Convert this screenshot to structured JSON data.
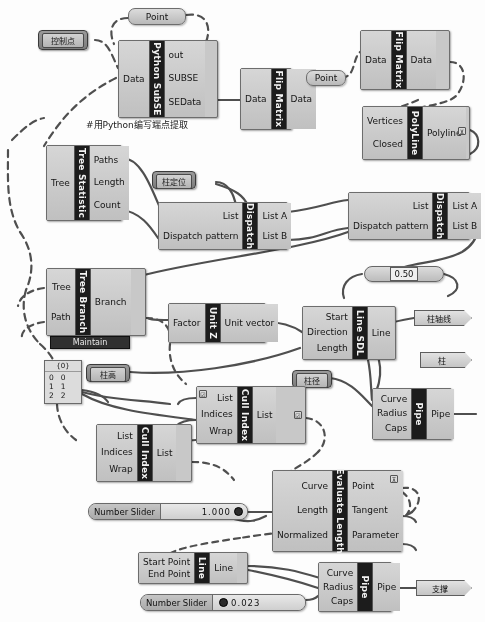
{
  "app": {
    "title": "Grasshopper Definition Canvas"
  },
  "comment": {
    "python_note": "#用Python编写端点提取"
  },
  "labels": {
    "control_points": "控制点",
    "column_position": "柱定位",
    "column_height": "柱高",
    "column_diameter": "柱径",
    "column_axis": "柱轴线",
    "column": "柱",
    "support": "支撑"
  },
  "components": [
    {
      "id": "python-subse",
      "name": "Python SubSE",
      "inputs": [
        "Data"
      ],
      "outputs": [
        "out",
        "SUBSE",
        "SEData"
      ]
    },
    {
      "id": "flip-matrix-1",
      "name": "Flip Matrix",
      "inputs": [
        "Data"
      ],
      "outputs": [
        "Data"
      ]
    },
    {
      "id": "flip-matrix-2",
      "name": "Flip Matrix",
      "inputs": [
        "Data"
      ],
      "outputs": [
        "Data"
      ]
    },
    {
      "id": "polyline",
      "name": "PolyLine",
      "inputs": [
        "Vertices",
        "Closed"
      ],
      "outputs": [
        "Polyline"
      ]
    },
    {
      "id": "tree-statistics",
      "name": "Tree Statistic",
      "inputs": [
        "Tree"
      ],
      "outputs": [
        "Paths",
        "Length",
        "Count"
      ]
    },
    {
      "id": "dispatch-1",
      "name": "Dispatch",
      "inputs": [
        "List",
        "Dispatch pattern"
      ],
      "outputs": [
        "List A",
        "List B"
      ]
    },
    {
      "id": "dispatch-2",
      "name": "Dispatch",
      "inputs": [
        "List",
        "Dispatch pattern"
      ],
      "outputs": [
        "List A",
        "List B"
      ]
    },
    {
      "id": "tree-branch",
      "name": "Tree Branch",
      "inputs": [
        "Tree",
        "Path"
      ],
      "outputs": [
        "Branch"
      ],
      "sub": "Maintain"
    },
    {
      "id": "unit-z",
      "name": "Unit Z",
      "inputs": [
        "Factor"
      ],
      "outputs": [
        "Unit vector"
      ]
    },
    {
      "id": "line-sdl",
      "name": "Line SDL",
      "inputs": [
        "Start",
        "Direction",
        "Length"
      ],
      "outputs": [
        "Line"
      ]
    },
    {
      "id": "cull-index-1",
      "name": "Cull Index",
      "inputs": [
        "List",
        "Indices",
        "Wrap"
      ],
      "outputs": [
        "List"
      ]
    },
    {
      "id": "cull-index-2",
      "name": "Cull Index",
      "inputs": [
        "List",
        "Indices",
        "Wrap"
      ],
      "outputs": [
        "List"
      ]
    },
    {
      "id": "pipe-1",
      "name": "Pipe",
      "inputs": [
        "Curve",
        "Radius",
        "Caps"
      ],
      "outputs": [
        "Pipe"
      ]
    },
    {
      "id": "pipe-2",
      "name": "Pipe",
      "inputs": [
        "Curve",
        "Radius",
        "Caps"
      ],
      "outputs": [
        "Pipe"
      ]
    },
    {
      "id": "evaluate-length",
      "name": "Evaluate Length",
      "inputs": [
        "Curve",
        "Length",
        "Normalized"
      ],
      "outputs": [
        "Point",
        "Tangent",
        "Parameter"
      ]
    },
    {
      "id": "line",
      "name": "Line",
      "inputs": [
        "Start Point",
        "End Point"
      ],
      "outputs": [
        "Line"
      ]
    }
  ],
  "params": {
    "point_1": "Point",
    "point_2": "Point",
    "data_1": "Data",
    "data_2": "Data"
  },
  "numbers": {
    "dispatch_value": "0.50",
    "slider_1_name": "Number Slider",
    "slider_1_value": "1.000",
    "slider_2_name": "Number Slider",
    "slider_2_value": "0.023"
  },
  "panel": {
    "header": "{0}",
    "rows": [
      [
        "0",
        "0"
      ],
      [
        "1",
        "1"
      ],
      [
        "2",
        "2"
      ]
    ]
  },
  "icons": {
    "flatten": "⊻",
    "graft": "⊼",
    "toggle": "☑",
    "knob": "◉"
  },
  "colors": {
    "component_body": "#c8c8c8",
    "spine": "#1c1c1c",
    "wire": "#4a4a4a",
    "label_dark": "#7c7c7c"
  }
}
